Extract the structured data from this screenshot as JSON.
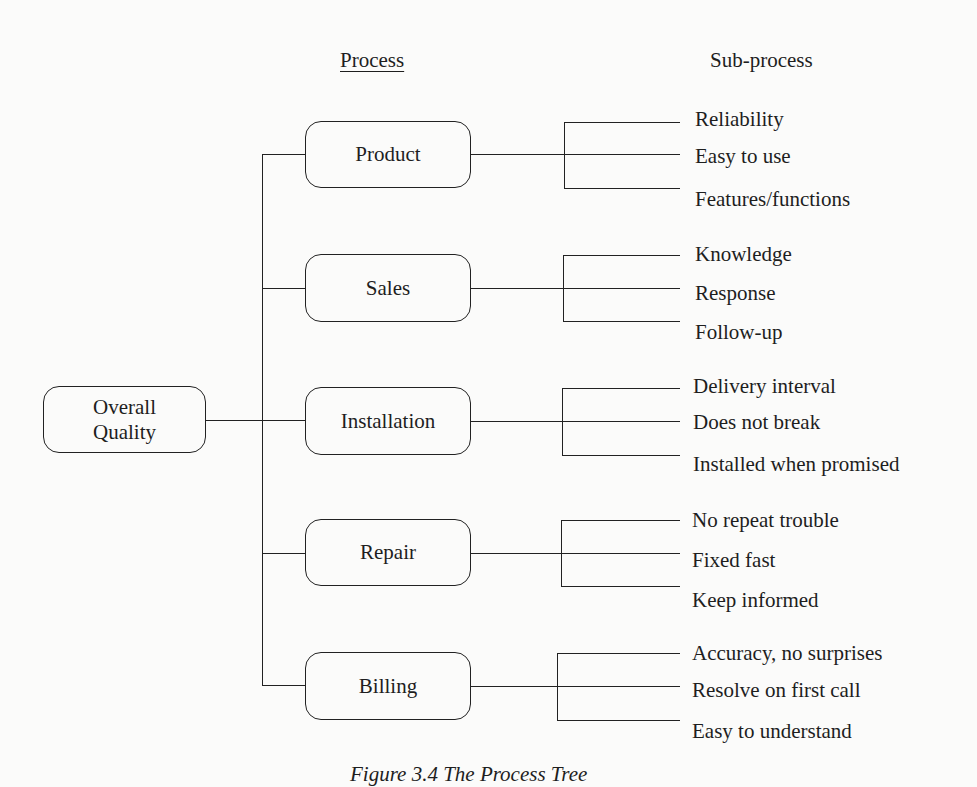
{
  "headers": {
    "process": "Process",
    "subprocess": "Sub-process"
  },
  "root": {
    "label_line1": "Overall",
    "label_line2": "Quality"
  },
  "processes": [
    {
      "label": "Product",
      "subs": [
        "Reliability",
        "Easy to use",
        "Features/functions"
      ]
    },
    {
      "label": "Sales",
      "subs": [
        "Knowledge",
        "Response",
        "Follow-up"
      ]
    },
    {
      "label": "Installation",
      "subs": [
        "Delivery interval",
        "Does not break",
        "Installed when promised"
      ]
    },
    {
      "label": "Repair",
      "subs": [
        "No repeat trouble",
        "Fixed fast",
        "Keep informed"
      ]
    },
    {
      "label": "Billing",
      "subs": [
        "Accuracy, no surprises",
        "Resolve on first call",
        "Easy to understand"
      ]
    }
  ],
  "caption": "Figure 3.4   The Process Tree"
}
